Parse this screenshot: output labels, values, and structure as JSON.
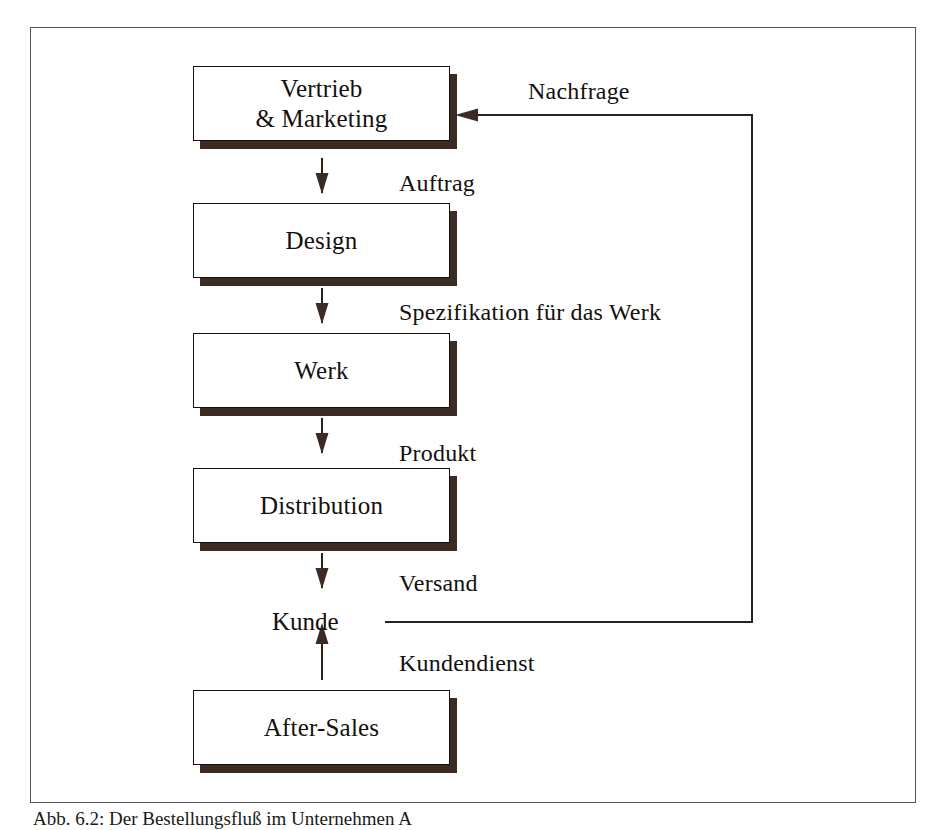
{
  "figure": {
    "caption": "Abb. 6.2:  Der Bestellungsfluß im Unternehmen A",
    "frame_color": "#55555c",
    "ink_color": "#14100e",
    "shadow_color": "#3c2b22",
    "background": "#ffffff"
  },
  "diagram": {
    "type": "flowchart",
    "orientation": "top-to-bottom",
    "nodes": [
      {
        "id": "vertrieb",
        "label": "Vertrieb\n& Marketing",
        "shape": "box-shadow"
      },
      {
        "id": "design",
        "label": "Design",
        "shape": "box-shadow"
      },
      {
        "id": "werk",
        "label": "Werk",
        "shape": "box-shadow"
      },
      {
        "id": "distribution",
        "label": "Distribution",
        "shape": "box-shadow"
      },
      {
        "id": "kunde",
        "label": "Kunde",
        "shape": "plain-text"
      },
      {
        "id": "after_sales",
        "label": "After-Sales",
        "shape": "box-shadow"
      }
    ],
    "edges": [
      {
        "from": "vertrieb",
        "to": "design",
        "label": "Auftrag",
        "direction": "down"
      },
      {
        "from": "design",
        "to": "werk",
        "label": "Spezifikation für das Werk",
        "direction": "down"
      },
      {
        "from": "werk",
        "to": "distribution",
        "label": "Produkt",
        "direction": "down"
      },
      {
        "from": "distribution",
        "to": "kunde",
        "label": "Versand",
        "direction": "down"
      },
      {
        "from": "after_sales",
        "to": "kunde",
        "label": "Kundendienst",
        "direction": "up"
      },
      {
        "from": "kunde",
        "to": "vertrieb",
        "label": "Nachfrage",
        "direction": "feedback-loop"
      }
    ]
  },
  "labels": {
    "vertrieb": "Vertrieb\n& Marketing",
    "design": "Design",
    "werk": "Werk",
    "distribution": "Distribution",
    "kunde": "Kunde",
    "after_sales": "After-Sales",
    "auftrag": "Auftrag",
    "spezifikation": "Spezifikation für das Werk",
    "produkt": "Produkt",
    "versand": "Versand",
    "kundendienst": "Kundendienst",
    "nachfrage": "Nachfrage"
  }
}
